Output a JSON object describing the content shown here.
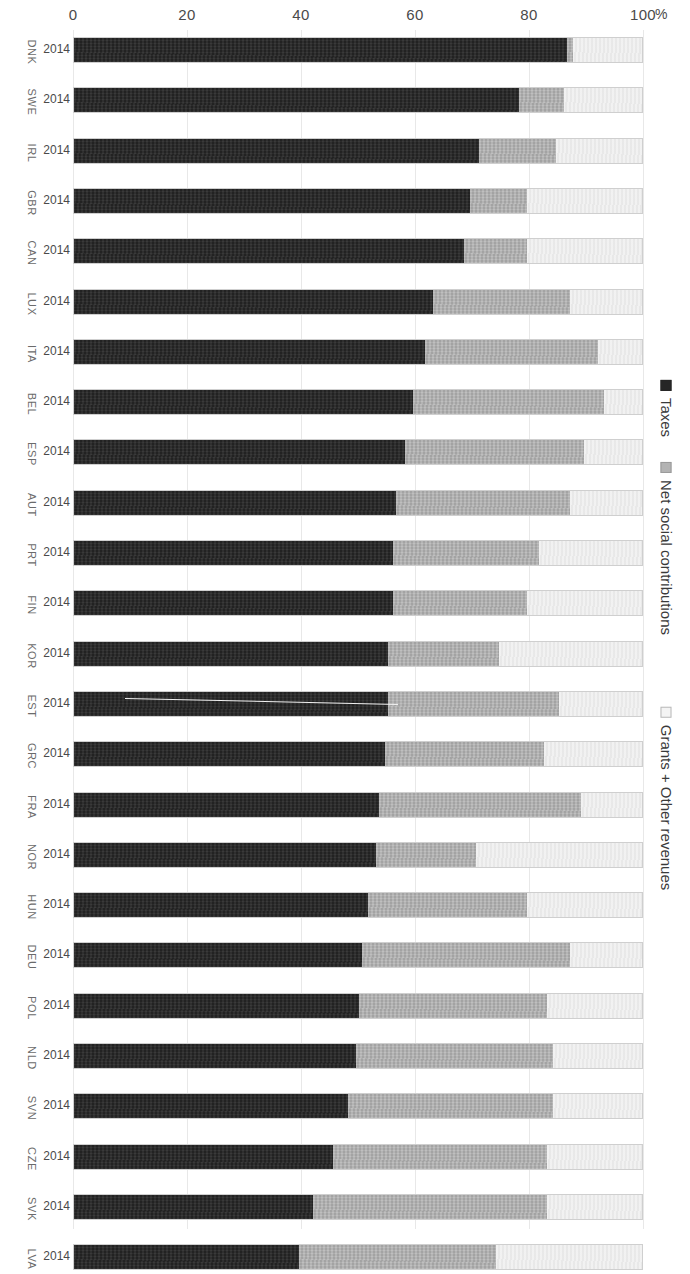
{
  "chart_data": {
    "type": "bar",
    "subtype": "horizontal-stacked-100",
    "title": "",
    "xlabel": "%",
    "ylabel": "",
    "xlim": [
      0,
      100
    ],
    "xticks": [
      0,
      20,
      40,
      60,
      80,
      100
    ],
    "unit_symbol": "%",
    "grid": true,
    "legend_position": "right",
    "year_label": "2014",
    "categories": [
      "DNK",
      "SWE",
      "IRL",
      "GBR",
      "CAN",
      "LUX",
      "ITA",
      "BEL",
      "ESP",
      "AUT",
      "PRT",
      "FIN",
      "KOR",
      "EST",
      "GRC",
      "FRA",
      "NOR",
      "HUN",
      "DEU",
      "POL",
      "NLD",
      "SVN",
      "CZE",
      "SVK",
      "LVA"
    ],
    "series": [
      {
        "name": "Taxes",
        "color": "#262626",
        "values": [
          86.5,
          78.0,
          71.0,
          69.5,
          68.5,
          63.0,
          61.5,
          59.5,
          58.0,
          56.5,
          56.0,
          56.0,
          55.0,
          55.0,
          54.5,
          53.5,
          53.0,
          51.5,
          50.5,
          50.0,
          49.5,
          48.0,
          45.5,
          42.0,
          39.5
        ]
      },
      {
        "name": "Net social contributions",
        "color": "#b3b3b3",
        "values": [
          1.0,
          8.0,
          13.5,
          10.0,
          11.0,
          24.0,
          30.5,
          33.5,
          31.5,
          30.5,
          25.5,
          23.5,
          19.5,
          30.0,
          28.0,
          35.5,
          17.5,
          28.0,
          36.5,
          33.0,
          34.5,
          36.0,
          37.5,
          41.0,
          34.5
        ]
      },
      {
        "name": "Grants + Other revenues",
        "color": "#ededed",
        "values": [
          12.5,
          14.0,
          15.5,
          20.5,
          20.5,
          13.0,
          8.0,
          7.0,
          10.5,
          13.0,
          18.5,
          20.5,
          25.5,
          15.0,
          17.5,
          11.0,
          29.5,
          20.5,
          13.0,
          17.0,
          16.0,
          16.0,
          17.0,
          17.0,
          26.0
        ]
      }
    ],
    "rows": [
      {
        "country": "DNK",
        "year": "2014",
        "taxes": 86.5,
        "net_social_contributions": 1.0,
        "grants_other": 12.5
      },
      {
        "country": "SWE",
        "year": "2014",
        "taxes": 78.0,
        "net_social_contributions": 8.0,
        "grants_other": 14.0
      },
      {
        "country": "IRL",
        "year": "2014",
        "taxes": 71.0,
        "net_social_contributions": 13.5,
        "grants_other": 15.5
      },
      {
        "country": "GBR",
        "year": "2014",
        "taxes": 69.5,
        "net_social_contributions": 10.0,
        "grants_other": 20.5
      },
      {
        "country": "CAN",
        "year": "2014",
        "taxes": 68.5,
        "net_social_contributions": 11.0,
        "grants_other": 20.5
      },
      {
        "country": "LUX",
        "year": "2014",
        "taxes": 63.0,
        "net_social_contributions": 24.0,
        "grants_other": 13.0
      },
      {
        "country": "ITA",
        "year": "2014",
        "taxes": 61.5,
        "net_social_contributions": 30.5,
        "grants_other": 8.0
      },
      {
        "country": "BEL",
        "year": "2014",
        "taxes": 59.5,
        "net_social_contributions": 33.5,
        "grants_other": 7.0
      },
      {
        "country": "ESP",
        "year": "2014",
        "taxes": 58.0,
        "net_social_contributions": 31.5,
        "grants_other": 10.5
      },
      {
        "country": "AUT",
        "year": "2014",
        "taxes": 56.5,
        "net_social_contributions": 30.5,
        "grants_other": 13.0
      },
      {
        "country": "PRT",
        "year": "2014",
        "taxes": 56.0,
        "net_social_contributions": 25.5,
        "grants_other": 18.5
      },
      {
        "country": "FIN",
        "year": "2014",
        "taxes": 56.0,
        "net_social_contributions": 23.5,
        "grants_other": 20.5
      },
      {
        "country": "KOR",
        "year": "2014",
        "taxes": 55.0,
        "net_social_contributions": 19.5,
        "grants_other": 25.5
      },
      {
        "country": "EST",
        "year": "2014",
        "taxes": 55.0,
        "net_social_contributions": 30.0,
        "grants_other": 15.0
      },
      {
        "country": "GRC",
        "year": "2014",
        "taxes": 54.5,
        "net_social_contributions": 28.0,
        "grants_other": 17.5
      },
      {
        "country": "FRA",
        "year": "2014",
        "taxes": 53.5,
        "net_social_contributions": 35.5,
        "grants_other": 11.0
      },
      {
        "country": "NOR",
        "year": "2014",
        "taxes": 53.0,
        "net_social_contributions": 17.5,
        "grants_other": 29.5
      },
      {
        "country": "HUN",
        "year": "2014",
        "taxes": 51.5,
        "net_social_contributions": 28.0,
        "grants_other": 20.5
      },
      {
        "country": "DEU",
        "year": "2014",
        "taxes": 50.5,
        "net_social_contributions": 36.5,
        "grants_other": 13.0
      },
      {
        "country": "POL",
        "year": "2014",
        "taxes": 50.0,
        "net_social_contributions": 33.0,
        "grants_other": 17.0
      },
      {
        "country": "NLD",
        "year": "2014",
        "taxes": 49.5,
        "net_social_contributions": 34.5,
        "grants_other": 16.0
      },
      {
        "country": "SVN",
        "year": "2014",
        "taxes": 48.0,
        "net_social_contributions": 36.0,
        "grants_other": 16.0
      },
      {
        "country": "CZE",
        "year": "2014",
        "taxes": 45.5,
        "net_social_contributions": 37.5,
        "grants_other": 17.0
      },
      {
        "country": "SVK",
        "year": "2014",
        "taxes": 42.0,
        "net_social_contributions": 41.0,
        "grants_other": 17.0
      },
      {
        "country": "LVA",
        "year": "2014",
        "taxes": 39.5,
        "net_social_contributions": 34.5,
        "grants_other": 26.0
      }
    ]
  },
  "axis": {
    "ticks": [
      "0",
      "20",
      "40",
      "60",
      "80",
      "100"
    ],
    "unit": "%"
  },
  "legend": {
    "items": [
      {
        "label": "Taxes",
        "color": "#262626"
      },
      {
        "label": "Net social contributions",
        "color": "#b3b3b3"
      },
      {
        "label": "Grants + Other revenues",
        "color": "#ededed"
      }
    ]
  },
  "colors": {
    "taxes": "#262626",
    "net_social_contributions": "#b3b3b3",
    "grants_other": "#ededed",
    "gridline": "#e8e8e8",
    "bar_border": "#cfcfcf",
    "text": "#3a3a3a"
  }
}
